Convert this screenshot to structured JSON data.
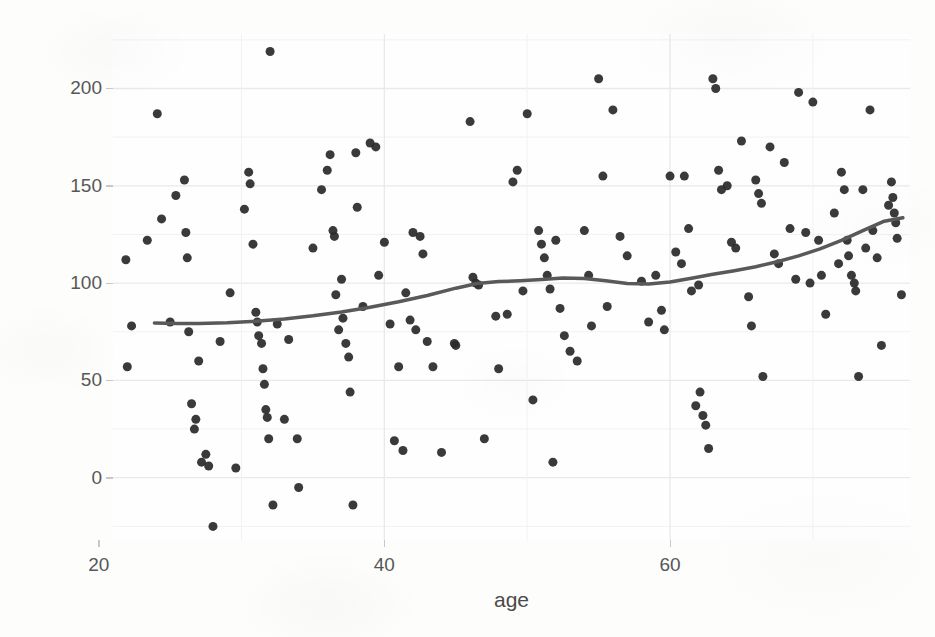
{
  "chart_data": {
    "type": "scatter",
    "title": "",
    "subtitle": "",
    "xlabel": "age",
    "ylabel": "ToT",
    "xlim": [
      21.0,
      76.8
    ],
    "ylim": [
      -32,
      228
    ],
    "xticks": [
      20,
      40,
      60
    ],
    "yticks": [
      0,
      50,
      100,
      150,
      200
    ],
    "grid": true,
    "legend": null,
    "point_color": "#2b2b2b",
    "point_size": 9,
    "panel_background": "#fefefe",
    "grid_color": "#e9e9e7",
    "smooth_line": {
      "name": "loess smooth",
      "color": "#595959",
      "width": 3.5,
      "x": [
        23.9,
        25.5,
        27.0,
        29.0,
        31.0,
        33.0,
        35.0,
        37.0,
        39.0,
        41.0,
        43.0,
        45.0,
        46.5,
        48.0,
        49.5,
        51.0,
        52.5,
        54.0,
        55.5,
        57.0,
        58.5,
        60.0,
        61.5,
        63.0,
        64.5,
        66.0,
        67.5,
        69.0,
        70.5,
        72.0,
        73.5,
        75.0,
        76.3
      ],
      "y": [
        79.5,
        79.3,
        79.2,
        79.6,
        80.4,
        81.6,
        83.2,
        85.2,
        87.6,
        90.4,
        93.6,
        97.4,
        99.8,
        100.8,
        101.2,
        101.8,
        102.6,
        102.4,
        101.2,
        99.8,
        99.5,
        100.6,
        102.5,
        104.6,
        106.4,
        108.4,
        111.0,
        114.0,
        117.6,
        122.0,
        127.0,
        131.8,
        133.6
      ]
    },
    "points": [
      [
        21.9,
        112.0
      ],
      [
        22.0,
        57.0
      ],
      [
        22.3,
        78.0
      ],
      [
        23.4,
        122.0
      ],
      [
        24.1,
        187.0
      ],
      [
        24.4,
        133.0
      ],
      [
        25.0,
        80.0
      ],
      [
        25.4,
        145.0
      ],
      [
        26.0,
        153.0
      ],
      [
        26.1,
        126.0
      ],
      [
        26.2,
        113.0
      ],
      [
        26.3,
        75.0
      ],
      [
        26.5,
        38.0
      ],
      [
        26.7,
        25.0
      ],
      [
        26.8,
        30.0
      ],
      [
        27.0,
        60.0
      ],
      [
        27.2,
        8.0
      ],
      [
        27.5,
        12.0
      ],
      [
        27.7,
        6.0
      ],
      [
        28.0,
        -25.0
      ],
      [
        28.5,
        70.0
      ],
      [
        29.2,
        95.0
      ],
      [
        29.6,
        5.0
      ],
      [
        30.2,
        138.0
      ],
      [
        30.5,
        157.0
      ],
      [
        30.6,
        151.0
      ],
      [
        30.8,
        120.0
      ],
      [
        31.0,
        85.0
      ],
      [
        31.1,
        80.0
      ],
      [
        31.2,
        73.0
      ],
      [
        31.4,
        69.0
      ],
      [
        31.5,
        56.0
      ],
      [
        31.6,
        48.0
      ],
      [
        31.7,
        35.0
      ],
      [
        31.8,
        31.0
      ],
      [
        31.9,
        20.0
      ],
      [
        32.0,
        219.0
      ],
      [
        32.2,
        -14.0
      ],
      [
        32.5,
        79.0
      ],
      [
        33.0,
        30.0
      ],
      [
        33.3,
        71.0
      ],
      [
        33.9,
        20.0
      ],
      [
        34.0,
        -5.0
      ],
      [
        35.0,
        118.0
      ],
      [
        35.6,
        148.0
      ],
      [
        36.0,
        158.0
      ],
      [
        36.2,
        166.0
      ],
      [
        36.4,
        127.0
      ],
      [
        36.5,
        124.0
      ],
      [
        36.6,
        94.0
      ],
      [
        36.8,
        76.0
      ],
      [
        37.0,
        102.0
      ],
      [
        37.1,
        82.0
      ],
      [
        37.3,
        69.0
      ],
      [
        37.5,
        62.0
      ],
      [
        37.6,
        44.0
      ],
      [
        37.8,
        -14.0
      ],
      [
        38.0,
        167.0
      ],
      [
        38.1,
        139.0
      ],
      [
        38.5,
        88.0
      ],
      [
        39.0,
        172.0
      ],
      [
        39.4,
        170.0
      ],
      [
        39.6,
        104.0
      ],
      [
        40.0,
        121.0
      ],
      [
        40.4,
        79.0
      ],
      [
        40.7,
        19.0
      ],
      [
        41.0,
        57.0
      ],
      [
        41.3,
        14.0
      ],
      [
        41.5,
        95.0
      ],
      [
        41.8,
        81.0
      ],
      [
        42.0,
        126.0
      ],
      [
        42.2,
        76.0
      ],
      [
        42.5,
        124.0
      ],
      [
        42.7,
        115.0
      ],
      [
        43.0,
        70.0
      ],
      [
        43.4,
        57.0
      ],
      [
        44.0,
        13.0
      ],
      [
        44.9,
        69.0
      ],
      [
        45.0,
        68.0
      ],
      [
        46.0,
        183.0
      ],
      [
        46.2,
        103.0
      ],
      [
        46.4,
        100.0
      ],
      [
        46.6,
        99.0
      ],
      [
        47.0,
        20.0
      ],
      [
        47.8,
        83.0
      ],
      [
        48.0,
        56.0
      ],
      [
        48.6,
        84.0
      ],
      [
        49.0,
        152.0
      ],
      [
        49.3,
        158.0
      ],
      [
        49.7,
        96.0
      ],
      [
        50.0,
        187.0
      ],
      [
        50.4,
        40.0
      ],
      [
        50.8,
        127.0
      ],
      [
        51.0,
        120.0
      ],
      [
        51.2,
        113.0
      ],
      [
        51.4,
        104.0
      ],
      [
        51.6,
        97.0
      ],
      [
        51.8,
        8.0
      ],
      [
        52.0,
        122.0
      ],
      [
        52.3,
        87.0
      ],
      [
        52.6,
        73.0
      ],
      [
        53.0,
        65.0
      ],
      [
        53.5,
        60.0
      ],
      [
        54.0,
        127.0
      ],
      [
        54.3,
        104.0
      ],
      [
        54.5,
        78.0
      ],
      [
        55.0,
        205.0
      ],
      [
        55.3,
        155.0
      ],
      [
        55.6,
        88.0
      ],
      [
        56.0,
        189.0
      ],
      [
        56.5,
        124.0
      ],
      [
        57.0,
        114.0
      ],
      [
        58.0,
        101.0
      ],
      [
        58.5,
        80.0
      ],
      [
        59.0,
        104.0
      ],
      [
        59.4,
        86.0
      ],
      [
        59.6,
        76.0
      ],
      [
        60.0,
        155.0
      ],
      [
        60.4,
        116.0
      ],
      [
        60.8,
        110.0
      ],
      [
        61.0,
        155.0
      ],
      [
        61.3,
        128.0
      ],
      [
        61.5,
        96.0
      ],
      [
        61.8,
        37.0
      ],
      [
        62.0,
        99.0
      ],
      [
        62.1,
        44.0
      ],
      [
        62.3,
        32.0
      ],
      [
        62.5,
        27.0
      ],
      [
        62.7,
        15.0
      ],
      [
        63.0,
        205.0
      ],
      [
        63.2,
        200.0
      ],
      [
        63.4,
        158.0
      ],
      [
        63.6,
        148.0
      ],
      [
        64.0,
        150.0
      ],
      [
        64.3,
        121.0
      ],
      [
        64.6,
        118.0
      ],
      [
        65.0,
        173.0
      ],
      [
        65.5,
        93.0
      ],
      [
        65.7,
        78.0
      ],
      [
        66.0,
        153.0
      ],
      [
        66.2,
        146.0
      ],
      [
        66.4,
        141.0
      ],
      [
        66.5,
        52.0
      ],
      [
        67.0,
        170.0
      ],
      [
        67.3,
        115.0
      ],
      [
        67.6,
        110.0
      ],
      [
        68.0,
        162.0
      ],
      [
        68.4,
        128.0
      ],
      [
        68.8,
        102.0
      ],
      [
        69.0,
        198.0
      ],
      [
        69.5,
        126.0
      ],
      [
        69.8,
        100.0
      ],
      [
        70.0,
        193.0
      ],
      [
        70.4,
        122.0
      ],
      [
        70.6,
        104.0
      ],
      [
        70.9,
        84.0
      ],
      [
        71.5,
        136.0
      ],
      [
        71.8,
        110.0
      ],
      [
        72.0,
        157.0
      ],
      [
        72.2,
        148.0
      ],
      [
        72.4,
        122.0
      ],
      [
        72.5,
        114.0
      ],
      [
        72.7,
        104.0
      ],
      [
        72.9,
        100.0
      ],
      [
        73.0,
        96.0
      ],
      [
        73.2,
        52.0
      ],
      [
        73.5,
        148.0
      ],
      [
        73.7,
        118.0
      ],
      [
        74.0,
        189.0
      ],
      [
        74.2,
        127.0
      ],
      [
        74.5,
        113.0
      ],
      [
        74.8,
        68.0
      ],
      [
        75.3,
        140.0
      ],
      [
        75.5,
        152.0
      ],
      [
        75.6,
        144.0
      ],
      [
        75.7,
        136.0
      ],
      [
        75.8,
        131.0
      ],
      [
        75.9,
        123.0
      ],
      [
        76.2,
        94.0
      ]
    ]
  }
}
